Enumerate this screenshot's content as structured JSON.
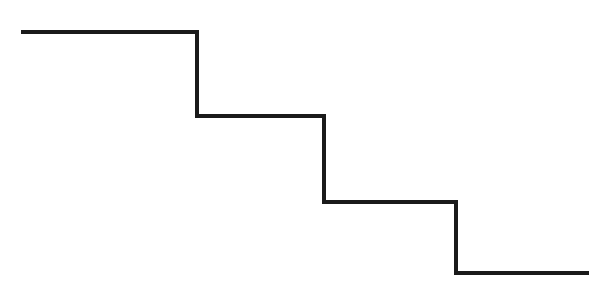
{
  "diagram": {
    "type": "step-line",
    "stroke_color": "#1a1a1a",
    "stroke_width": 4,
    "background": "#ffffff",
    "points": [
      [
        21,
        32
      ],
      [
        197,
        32
      ],
      [
        197,
        116
      ],
      [
        324,
        116
      ],
      [
        324,
        202
      ],
      [
        456,
        202
      ],
      [
        456,
        273
      ],
      [
        589,
        273
      ]
    ]
  }
}
